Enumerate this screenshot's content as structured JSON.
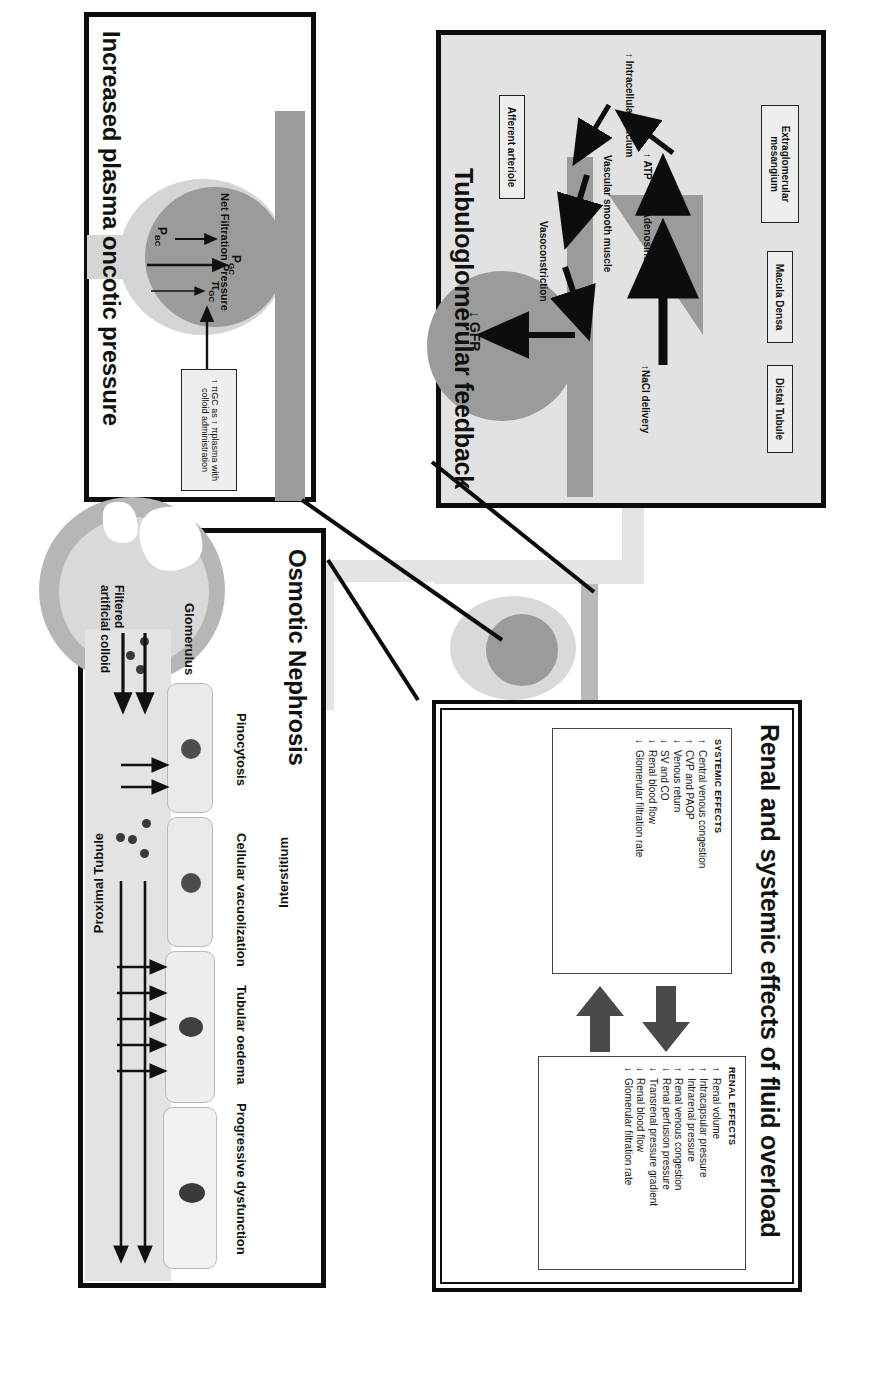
{
  "figure": {
    "kind": "medical-mechanism-diagram",
    "orientation": "rotated-90-clockwise"
  },
  "panels": {
    "tgf": {
      "title": "Tubuloglomerular feedback",
      "boxes": [
        {
          "name": "extraglomerular-mesangium",
          "label": "Extraglomerular mesangium"
        },
        {
          "name": "macula-densa",
          "label": "Macula Densa"
        },
        {
          "name": "distal-tubule",
          "label": "Distal Tubule"
        },
        {
          "name": "afferent-arteriole",
          "label": "Afferent arteriole"
        }
      ],
      "labels": {
        "intracellular_calcium": "↑ Intracellular calcium",
        "atp": "↑ ATP",
        "adenosine": "↑ Adenosine",
        "nacl_delivery": "↑NaCl delivery",
        "vascular_smooth_muscle": "Vascular smooth muscle",
        "vasoconstriction": "Vasoconstriction",
        "gfr": "↓ GFR"
      }
    },
    "effects": {
      "title": "Renal and systemic effects of fluid overload",
      "renal": {
        "heading": "RENAL EFFECTS",
        "items": [
          {
            "arrow": "↑",
            "text": "Renal volume"
          },
          {
            "arrow": "↑",
            "text": "Intracapsular pressure"
          },
          {
            "arrow": "↑",
            "text": "Intrarenal pressure"
          },
          {
            "arrow": "↑",
            "text": "Renal venous congestion"
          },
          {
            "arrow": "↓",
            "text": "Renal perfusion pressure"
          },
          {
            "arrow": "↓",
            "text": "Transrenal pressure gradient"
          },
          {
            "arrow": "↓",
            "text": "Renal blood flow"
          },
          {
            "arrow": "↓",
            "text": "Glomerular filtration rate"
          }
        ]
      },
      "systemic": {
        "heading": "SYSTEMIC EFFECTS",
        "items": [
          {
            "arrow": "↑",
            "text": "Central venous congestion"
          },
          {
            "arrow": "↑",
            "text": "CVP and PAOP"
          },
          {
            "arrow": "↓",
            "text": "Venous return"
          },
          {
            "arrow": "↓",
            "text": "SV and CO"
          },
          {
            "arrow": "↓",
            "text": "Renal blood flow"
          },
          {
            "arrow": "↓",
            "text": "Glomerular filtration rate"
          }
        ]
      }
    },
    "oncotic": {
      "title": "Increased plasma oncotic pressure",
      "labels": {
        "net_filtration_pressure": "Net Filtration Pressure",
        "p_bc": "P",
        "p_bc_sub": "BC",
        "p_gc": "P",
        "p_gc_sub": "GC",
        "pi_gc": "π",
        "pi_gc_sub": "GC"
      },
      "callout": "↑ πGC as ↑ πplasma with colloid administration"
    },
    "nephrosis": {
      "title": "Osmotic Nephrosis",
      "labels": {
        "glomerulus": "Glomerulus",
        "filtered_artificial_colloid": "Filtered artificial colloid",
        "pinocytosis": "Pinocytosis",
        "cellular_vacuolization": "Cellular vacuolization",
        "tubular_oedema": "Tubular oedema",
        "progressive_dysfunction": "Progressive dysfunction",
        "interstitium": "Interstitium",
        "proximal_tubule": "Proximal Tubule"
      }
    }
  },
  "colors": {
    "ink": "#0d0d0d",
    "panel_fill_grey": "#e2e2e2",
    "mid_grey": "#9b9b9b",
    "light_grey": "#d5d5d5",
    "arrow_grey": "#6f6f6f"
  }
}
